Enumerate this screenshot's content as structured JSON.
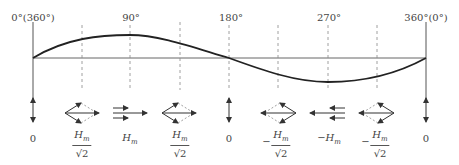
{
  "angle_labels": {
    "start": "0°(360°)",
    "a90": "90°",
    "a180": "180°",
    "a270": "270°",
    "end": "360°(0°)"
  },
  "field_labels": [
    {
      "id": "f0",
      "text": "0"
    },
    {
      "id": "f45",
      "sign": "",
      "num": "H",
      "sub": "m",
      "den": "√2"
    },
    {
      "id": "f90",
      "text": "H",
      "sub": "m"
    },
    {
      "id": "f135",
      "sign": "",
      "num": "H",
      "sub": "m",
      "den": "√2"
    },
    {
      "id": "f180",
      "text": "0"
    },
    {
      "id": "f225",
      "sign": "−",
      "num": "H",
      "sub": "m",
      "den": "√2"
    },
    {
      "id": "f270",
      "text": "−H",
      "sub": "m"
    },
    {
      "id": "f315",
      "sign": "−",
      "num": "H",
      "sub": "m",
      "den": "√2"
    },
    {
      "id": "f360",
      "text": "0"
    }
  ],
  "colors": {
    "curve": "#222222",
    "axis": "#555555",
    "dashed": "#777777",
    "vector": "#333333",
    "vector_dashed": "#888888"
  }
}
